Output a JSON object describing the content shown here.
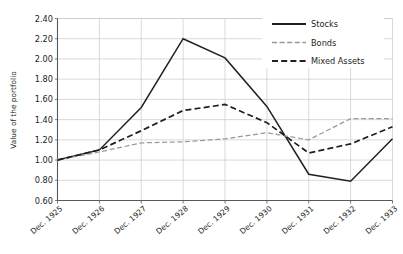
{
  "chart_data": {
    "type": "line",
    "title": "",
    "xlabel": "",
    "ylabel": "Value of the portfolio",
    "categories": [
      "Dec. 1925",
      "Dec. 1926",
      "Dec. 1927",
      "Dec. 1928",
      "Dec. 1929",
      "Dec. 1930",
      "Dec. 1931",
      "Dec. 1932",
      "Dec. 1933"
    ],
    "ylim": [
      0.6,
      2.4
    ],
    "yticks": [
      "0.60",
      "0.80",
      "1.00",
      "1.20",
      "1.40",
      "1.60",
      "1.80",
      "2.00",
      "2.20",
      "2.40"
    ],
    "ytick_values": [
      0.6,
      0.8,
      1.0,
      1.2,
      1.4,
      1.6,
      1.8,
      2.0,
      2.2,
      2.4
    ],
    "grid": "horizontal-and-vertical",
    "legend_position": "top-right",
    "series": [
      {
        "name": "Stocks",
        "values": [
          1.0,
          1.1,
          1.52,
          2.2,
          2.01,
          1.53,
          0.86,
          0.79,
          1.21
        ],
        "color": "#231f20",
        "style": "solid"
      },
      {
        "name": "Bonds",
        "values": [
          1.0,
          1.08,
          1.17,
          1.18,
          1.21,
          1.27,
          1.2,
          1.41,
          1.41
        ],
        "color": "#9a9a9a",
        "style": "dashed-fine"
      },
      {
        "name": "Mixed Assets",
        "values": [
          1.0,
          1.1,
          1.29,
          1.49,
          1.55,
          1.37,
          1.07,
          1.16,
          1.33
        ],
        "color": "#231f20",
        "style": "dashed"
      }
    ]
  },
  "legend": {
    "items": [
      {
        "label": "Stocks"
      },
      {
        "label": "Bonds"
      },
      {
        "label": "Mixed Assets"
      }
    ]
  }
}
